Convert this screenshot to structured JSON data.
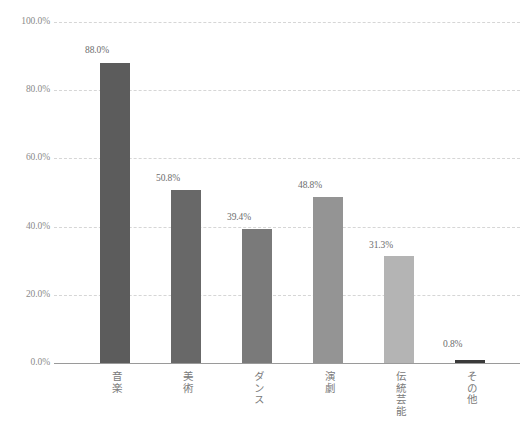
{
  "chart_data": {
    "type": "bar",
    "title": "",
    "subtitle": "",
    "xlabel": "",
    "ylabel": "",
    "categories": [
      "音楽",
      "美術",
      "ダンス",
      "演劇",
      "伝統芸能",
      "その他"
    ],
    "values": [
      88.0,
      50.8,
      39.4,
      48.8,
      31.3,
      0.8
    ],
    "value_labels": [
      "88.0%",
      "50.8%",
      "39.4%",
      "48.8%",
      "31.3%",
      "0.8%"
    ],
    "ylim": [
      0,
      100
    ],
    "yticks": [
      100.0,
      80.0,
      60.0,
      40.0,
      20.0,
      0.0
    ],
    "ytick_labels": [
      "100.0%",
      "80.0%",
      "60.0%",
      "40.0%",
      "20.0%",
      "0.0%"
    ],
    "grid": true,
    "grid_style": "dashed",
    "grid_color": "#d6d6d6",
    "legend": false,
    "legend_position": "none",
    "bar_colors": [
      "#5c5c5c",
      "#686868",
      "#7a7a7a",
      "#949494",
      "#b4b4b4",
      "#3a3a3a"
    ],
    "axis_color": "#9a9a9a",
    "label_color": "#7a7a7a",
    "value_color": "#6d6d6d",
    "background": "#ffffff"
  }
}
